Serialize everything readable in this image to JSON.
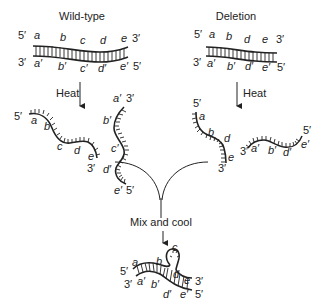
{
  "panels": {
    "wildtype": {
      "title": "Wild-type",
      "top_strand": {
        "five": "5′",
        "three": "3′",
        "segments": [
          "a",
          "b",
          "c",
          "d",
          "e"
        ]
      },
      "bottom_strand": {
        "three": "3′",
        "five": "5′",
        "segments": [
          "a′",
          "b′",
          "c′",
          "d′",
          "e′"
        ]
      }
    },
    "deletion": {
      "title": "Deletion",
      "top_strand": {
        "five": "5′",
        "three": "3′",
        "segments": [
          "a",
          "b",
          "d",
          "e"
        ]
      },
      "bottom_strand": {
        "three": "3′",
        "five": "5′",
        "segments": [
          "a′",
          "b′",
          "d′",
          "e′"
        ]
      }
    }
  },
  "steps": {
    "heat": "Heat",
    "mix": "Mix and cool"
  },
  "wt_single": {
    "top": {
      "five": "5′",
      "three": "3′",
      "segments": [
        "a",
        "b",
        "c",
        "d",
        "e"
      ]
    },
    "bottom": {
      "three": "3′",
      "five": "5′",
      "segments": [
        "a′",
        "b′",
        "c′",
        "d′",
        "e′"
      ]
    }
  },
  "del_single": {
    "top": {
      "five": "5′",
      "three": "3′",
      "segments": [
        "a",
        "b",
        "d",
        "e"
      ]
    },
    "bottom": {
      "three": "3′",
      "five": "5′",
      "segments": [
        "a′",
        "b′",
        "d′",
        "e′"
      ]
    }
  },
  "heteroduplex": {
    "top": {
      "five": "5′",
      "three": "3′",
      "segments": [
        "a",
        "b",
        "c",
        "d",
        "e"
      ]
    },
    "bottom": {
      "three": "3′",
      "five": "5′",
      "segments": [
        "a′",
        "b′",
        "d′",
        "e′"
      ]
    }
  }
}
